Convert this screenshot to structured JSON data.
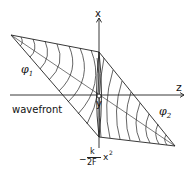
{
  "diagram": {
    "labels": {
      "x_axis": "x",
      "z_axis": "z",
      "y_axis": "y",
      "phi1": "φ",
      "phi1_sub": "1",
      "phi2": "φ",
      "phi2_sub": "2",
      "wavefront": "wavefront",
      "phase_minus": "−",
      "phase_num": "k",
      "phase_den": "2F",
      "phase_var": "x",
      "phase_exp": "2"
    },
    "colors": {
      "line": "#222222",
      "background": "#ffffff"
    }
  }
}
